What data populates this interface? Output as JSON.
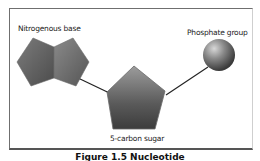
{
  "figure": {
    "labels": {
      "base": "Nitrogenous base",
      "phosphate": "Phosphate group",
      "sugar": "5-carbon sugar"
    },
    "caption": "Figure 1.5  Nucleotide",
    "colors": {
      "frame": "#6f6f6f",
      "shape_dark": "#3a3a3a",
      "shape_light": "#9a9a9a",
      "bond": "#222222"
    }
  }
}
